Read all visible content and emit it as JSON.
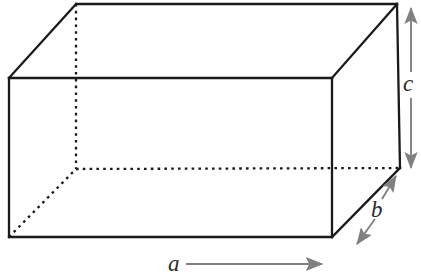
{
  "figure": {
    "kind": "rectangular-box-diagram",
    "background_color": "#ffffff",
    "edge_color": "#1a1a1a",
    "hidden_edge_color": "#1a1a1a",
    "dimension_color": "#808080",
    "label_color": "#2b2b2b",
    "edge_width": 2.2,
    "hidden_edge_width": 2.2,
    "hidden_edge_style": "dotted",
    "dimension_width": 1.8
  },
  "box": {
    "front_face": {
      "top_left": [
        9,
        78
      ],
      "top_right": [
        332,
        78
      ],
      "bottom_right": [
        332,
        237
      ],
      "bottom_left": [
        9,
        237
      ]
    },
    "back_face": {
      "top_left": [
        76,
        4
      ],
      "top_right": [
        397,
        4
      ],
      "bottom_right": [
        400,
        168
      ],
      "bottom_left": [
        76,
        169
      ]
    },
    "visible_edges": [
      "front-top",
      "front-right",
      "front-bottom",
      "front-left",
      "back-top",
      "back-right",
      "top-left-diagonal",
      "top-right-diagonal",
      "bottom-right-diagonal"
    ],
    "hidden_edges": [
      "back-left-vertical",
      "back-bottom-horizontal",
      "bottom-left-diagonal"
    ]
  },
  "dimensions": [
    {
      "id": "a",
      "label": "a",
      "measures": "width",
      "orientation": "horizontal",
      "arrow_heads": "both",
      "from": [
        9,
        264
      ],
      "to": [
        322,
        264
      ],
      "label_position": [
        177,
        264
      ]
    },
    {
      "id": "b",
      "label": "b",
      "measures": "depth",
      "orientation": "diagonal",
      "arrow_heads": "both",
      "from": [
        357,
        243
      ],
      "to": [
        396,
        176
      ],
      "label_position": [
        378,
        210
      ]
    },
    {
      "id": "c",
      "label": "c",
      "measures": "height",
      "orientation": "vertical",
      "arrow_heads": "both",
      "from": [
        411,
        8
      ],
      "to": [
        411,
        168
      ],
      "label_position": [
        410,
        84
      ]
    }
  ]
}
